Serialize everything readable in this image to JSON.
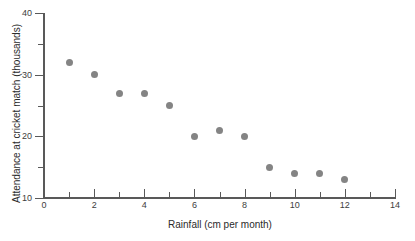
{
  "chart_data": {
    "type": "scatter",
    "title": "",
    "xlabel": "Rainfall (cm per month)",
    "ylabel": "Attendance at cricket match (thousands)",
    "xlim": [
      0,
      14
    ],
    "ylim": [
      10,
      40
    ],
    "grid": false,
    "legend": null,
    "marker_color": "#848484",
    "axis_color": "#595959",
    "x": [
      1,
      2,
      3,
      4,
      5,
      6,
      7,
      8,
      9,
      10,
      11,
      12
    ],
    "y": [
      32,
      30,
      27,
      27,
      25,
      20,
      21,
      20,
      15,
      14,
      14,
      13
    ],
    "points": [
      {
        "x": 1,
        "y": 32
      },
      {
        "x": 2,
        "y": 30
      },
      {
        "x": 3,
        "y": 27
      },
      {
        "x": 4,
        "y": 27
      },
      {
        "x": 5,
        "y": 25
      },
      {
        "x": 6,
        "y": 20
      },
      {
        "x": 7,
        "y": 21
      },
      {
        "x": 8,
        "y": 20
      },
      {
        "x": 9,
        "y": 15
      },
      {
        "x": 10,
        "y": 14
      },
      {
        "x": 11,
        "y": 14
      },
      {
        "x": 12,
        "y": 13
      }
    ],
    "x_ticks": [
      {
        "value": 0,
        "label": "0",
        "major": true
      },
      {
        "value": 1,
        "label": "",
        "major": false
      },
      {
        "value": 2,
        "label": "2",
        "major": true
      },
      {
        "value": 3,
        "label": "",
        "major": false
      },
      {
        "value": 4,
        "label": "4",
        "major": true
      },
      {
        "value": 5,
        "label": "",
        "major": false
      },
      {
        "value": 6,
        "label": "6",
        "major": true
      },
      {
        "value": 7,
        "label": "",
        "major": false
      },
      {
        "value": 8,
        "label": "8",
        "major": true
      },
      {
        "value": 9,
        "label": "",
        "major": false
      },
      {
        "value": 10,
        "label": "10",
        "major": true
      },
      {
        "value": 11,
        "label": "",
        "major": false
      },
      {
        "value": 12,
        "label": "12",
        "major": true
      },
      {
        "value": 13,
        "label": "",
        "major": false
      },
      {
        "value": 14,
        "label": "14",
        "major": true
      }
    ],
    "y_ticks": [
      {
        "value": 10,
        "label": "10",
        "major": true
      },
      {
        "value": 15,
        "label": "",
        "major": false
      },
      {
        "value": 20,
        "label": "20",
        "major": true
      },
      {
        "value": 25,
        "label": "",
        "major": false
      },
      {
        "value": 30,
        "label": "30",
        "major": true
      },
      {
        "value": 35,
        "label": "",
        "major": false
      },
      {
        "value": 40,
        "label": "40",
        "major": true
      }
    ]
  }
}
